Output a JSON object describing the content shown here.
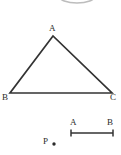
{
  "figure": {
    "background_color": "#ffffff",
    "stroke_color": "#333333",
    "label_color": "#2b2b2b",
    "canvas": {
      "width": 121,
      "height": 155
    },
    "partial_shape_top": {
      "name": "ellipse-arc-clipped",
      "description": "faint partial oval clipped by the top edge",
      "color": "#b9b9b9",
      "cx": 77,
      "cy": -4,
      "rx": 18,
      "ry": 7
    },
    "triangle": {
      "name": "triangle-ABC",
      "vertices": [
        {
          "label": "A",
          "x": 53,
          "y": 36
        },
        {
          "label": "B",
          "x": 10,
          "y": 93
        },
        {
          "label": "C",
          "x": 112,
          "y": 93
        }
      ],
      "labels": [
        {
          "text": "A",
          "position": "above-apex"
        },
        {
          "text": "B",
          "position": "below-left"
        },
        {
          "text": "C",
          "position": "below-right"
        }
      ]
    },
    "segment": {
      "name": "measured-segment-AB",
      "x1": 71,
      "x2": 113,
      "y": 133,
      "tick_height": 7,
      "labels": [
        {
          "text": "A",
          "position": "above-left-end"
        },
        {
          "text": "B",
          "position": "above-right-end"
        }
      ]
    },
    "point": {
      "name": "point-P",
      "label": "P",
      "dot_x": 54,
      "dot_y": 144,
      "dot_radius": 1.6
    }
  }
}
